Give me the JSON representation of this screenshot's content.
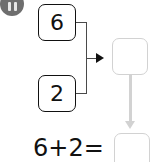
{
  "canvas": {
    "width": 153,
    "height": 162,
    "background_color": "#ffffff"
  },
  "status_badge": {
    "icon": "pause-icon",
    "shape": "circle",
    "color": "#6e6e6e",
    "bar_color": "#e8e8e8",
    "bars": 2,
    "clipped": "top"
  },
  "addends": [
    {
      "name": "first-addend",
      "value": "6",
      "border_color": "#111111",
      "text_color": "#111111"
    },
    {
      "name": "second-addend",
      "value": "2",
      "border_color": "#111111",
      "text_color": "#111111"
    }
  ],
  "result_box": {
    "name": "sum-result-box",
    "value": "",
    "empty": true,
    "border_color": "#d2d2d2"
  },
  "connector": {
    "type": "bracket",
    "line_color": "#4a4a4a",
    "arrow_color": "#111111",
    "direction": "right"
  },
  "down_arrow": {
    "color": "#d2d2d2",
    "direction": "down"
  },
  "equation": {
    "name": "addition-equation",
    "text": "6+2=",
    "left_operand": "6",
    "operator": "+",
    "right_operand": "2",
    "equals": "=",
    "answer_value": "",
    "answer_empty": true,
    "answer_border_color": "#d2d2d2",
    "text_color": "#111111"
  }
}
